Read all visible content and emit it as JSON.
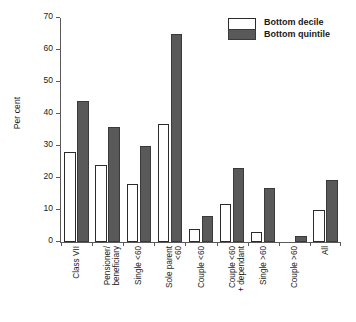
{
  "chart_data": {
    "type": "bar",
    "title": "",
    "xlabel": "",
    "ylabel": "Per cent",
    "ylim": [
      0,
      70
    ],
    "yticks": [
      0,
      10,
      20,
      30,
      40,
      50,
      60,
      70
    ],
    "ytick_labels": [
      "0",
      "10",
      "20",
      "30",
      "40",
      "50",
      "60",
      "70"
    ],
    "grid": false,
    "legend_position": "top-right",
    "categories": [
      "Class VII",
      "Pensioner/ beneficiary",
      "Single <60",
      "Sole parent <60",
      "Couple <60",
      "Couple <60 + dependant",
      "Single >60",
      "Couple >60",
      "All"
    ],
    "category_lines": [
      [
        "Class VII"
      ],
      [
        "Pensioner/",
        "beneficiary"
      ],
      [
        "Single <60"
      ],
      [
        "Sole parent",
        "<60"
      ],
      [
        "Couple <60"
      ],
      [
        "Couple <60",
        "+ dependant"
      ],
      [
        "Single >60"
      ],
      [
        "Couple >60"
      ],
      [
        "All"
      ]
    ],
    "series": [
      {
        "name": "Bottom decile",
        "color": "#ffffff",
        "values": [
          28,
          24,
          18,
          37,
          4,
          12,
          3,
          0,
          10
        ]
      },
      {
        "name": "Bottom quintile",
        "color": "#595959",
        "values": [
          44,
          36,
          30,
          65,
          8,
          23,
          17,
          2,
          19.5
        ]
      }
    ]
  },
  "legend": {
    "items": [
      {
        "label": "Bottom decile",
        "swatch": "white-swatch"
      },
      {
        "label": "Bottom quintile",
        "swatch": "dark-gray-swatch"
      }
    ]
  },
  "colors": {
    "decile_fill": "#ffffff",
    "quintile_fill": "#595959",
    "bar_border": "#2b2b2b",
    "axis": "#5a5a5a",
    "text": "#1a1a1a",
    "background": "#ffffff"
  }
}
